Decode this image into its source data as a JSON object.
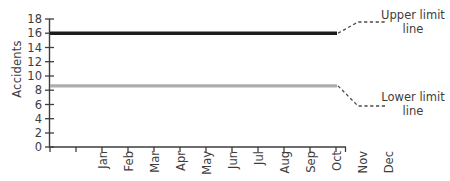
{
  "chart_data": {
    "type": "line",
    "title": "",
    "xlabel": "",
    "ylabel": "Accidents",
    "categories": [
      "Jan",
      "Feb",
      "Mar",
      "Apr",
      "May",
      "Jun",
      "Jul",
      "Aug",
      "Sep",
      "Oct",
      "Nov",
      "Dec"
    ],
    "ylim": [
      0,
      18
    ],
    "y_ticks": [
      0,
      2,
      4,
      6,
      8,
      10,
      12,
      14,
      16,
      18
    ],
    "grid": false,
    "legend": "none",
    "series": [
      {
        "name": "Upper limit line",
        "color": "#1c1c1c",
        "values": [
          16,
          16,
          16,
          16,
          16,
          16,
          16,
          16,
          16,
          16,
          16,
          16
        ]
      },
      {
        "name": "Lower limit line",
        "color": "#adadad",
        "values": [
          8.6,
          8.6,
          8.6,
          8.6,
          8.6,
          8.6,
          8.6,
          8.6,
          8.6,
          8.6,
          8.6,
          8.6
        ]
      }
    ],
    "annotations": [
      {
        "id": "upper-limit",
        "line1": "Upper limit",
        "line2": "line",
        "target_series": "Upper limit line",
        "target_value": 16,
        "leader_style": "dashed"
      },
      {
        "id": "lower-limit",
        "line1": "Lower limit",
        "line2": "line",
        "target_series": "Lower limit line",
        "target_value": 8.6,
        "leader_style": "dashed"
      }
    ]
  },
  "axis": {
    "y_tick_labels": [
      "18",
      "16",
      "14",
      "12",
      "10",
      "8",
      "6",
      "4",
      "2",
      "0"
    ],
    "x_tick_labels": [
      "Jan",
      "Feb",
      "Mar",
      "Apr",
      "May",
      "Jun",
      "Jul",
      "Aug",
      "Sep",
      "Oct",
      "Nov",
      "Dec"
    ],
    "y_title": "Accidents",
    "axis_color": "#3d3d3d"
  },
  "colors": {
    "upper_line": "#1c1c1c",
    "lower_line": "#adadad",
    "axis": "#3d3d3d",
    "leader": "#4a4a4a",
    "background": "#ffffff"
  }
}
